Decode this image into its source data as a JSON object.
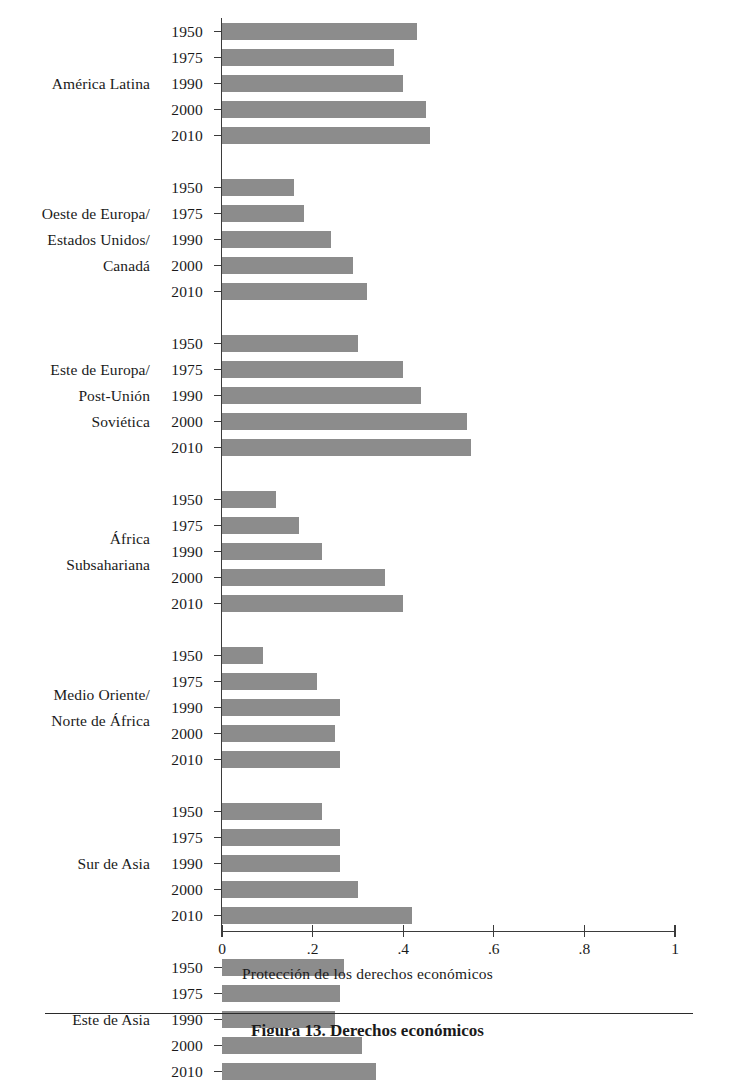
{
  "chart_data": {
    "type": "bar",
    "orientation": "horizontal",
    "title": "",
    "xlabel": "Protección de los derechos económicos",
    "ylabel": "",
    "xlim": [
      0,
      1
    ],
    "xticks": [
      "0",
      ".2",
      ".4",
      ".6",
      ".8",
      "1"
    ],
    "xtick_values": [
      0,
      0.2,
      0.4,
      0.6,
      0.8,
      1
    ],
    "grid": false,
    "legend": null,
    "bar_color": "#8c8c8c",
    "axis_color": "#3b3b3b",
    "categories": [
      "1950",
      "1975",
      "1990",
      "2000",
      "2010"
    ],
    "groups": [
      {
        "label": "América Latina",
        "values": [
          0.43,
          0.38,
          0.4,
          0.45,
          0.46
        ]
      },
      {
        "label": "Oeste de Europa/\nEstados Unidos/\nCanadá",
        "values": [
          0.16,
          0.18,
          0.24,
          0.29,
          0.32
        ]
      },
      {
        "label": "Este de Europa/\nPost-Unión\nSoviética",
        "values": [
          0.3,
          0.4,
          0.44,
          0.54,
          0.55
        ]
      },
      {
        "label": "África\nSubsahariana",
        "values": [
          0.12,
          0.17,
          0.22,
          0.36,
          0.4
        ]
      },
      {
        "label": "Medio Oriente/\nNorte de África",
        "values": [
          0.09,
          0.21,
          0.26,
          0.25,
          0.26
        ]
      },
      {
        "label": "Sur de Asia",
        "values": [
          0.22,
          0.26,
          0.26,
          0.3,
          0.42
        ]
      },
      {
        "label": "Este de Asia",
        "values": [
          0.27,
          0.26,
          0.25,
          0.31,
          0.34
        ]
      }
    ]
  },
  "axis": {
    "xlabel": "Protección de los derechos económicos"
  },
  "caption": {
    "text": "Figura 13. Derechos económicos"
  }
}
